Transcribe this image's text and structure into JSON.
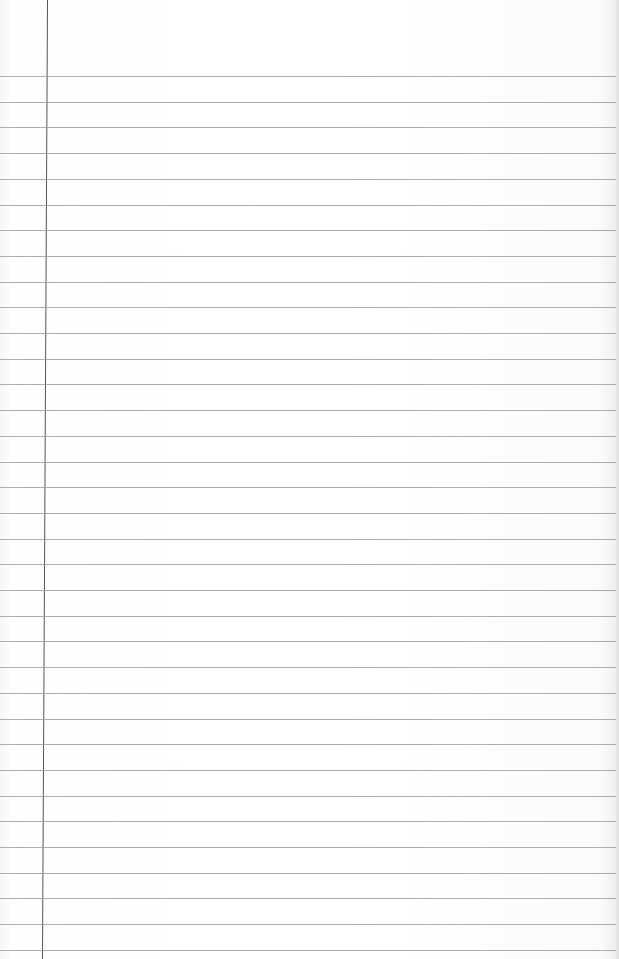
{
  "paper": {
    "type": "ruled notebook page",
    "background_color": "#ffffff",
    "rule_color": "#9a9a9a",
    "margin_color": "#555555",
    "first_rule_y": 76,
    "rule_spacing": 25.7,
    "rule_count": 35,
    "margin_x": 47
  }
}
